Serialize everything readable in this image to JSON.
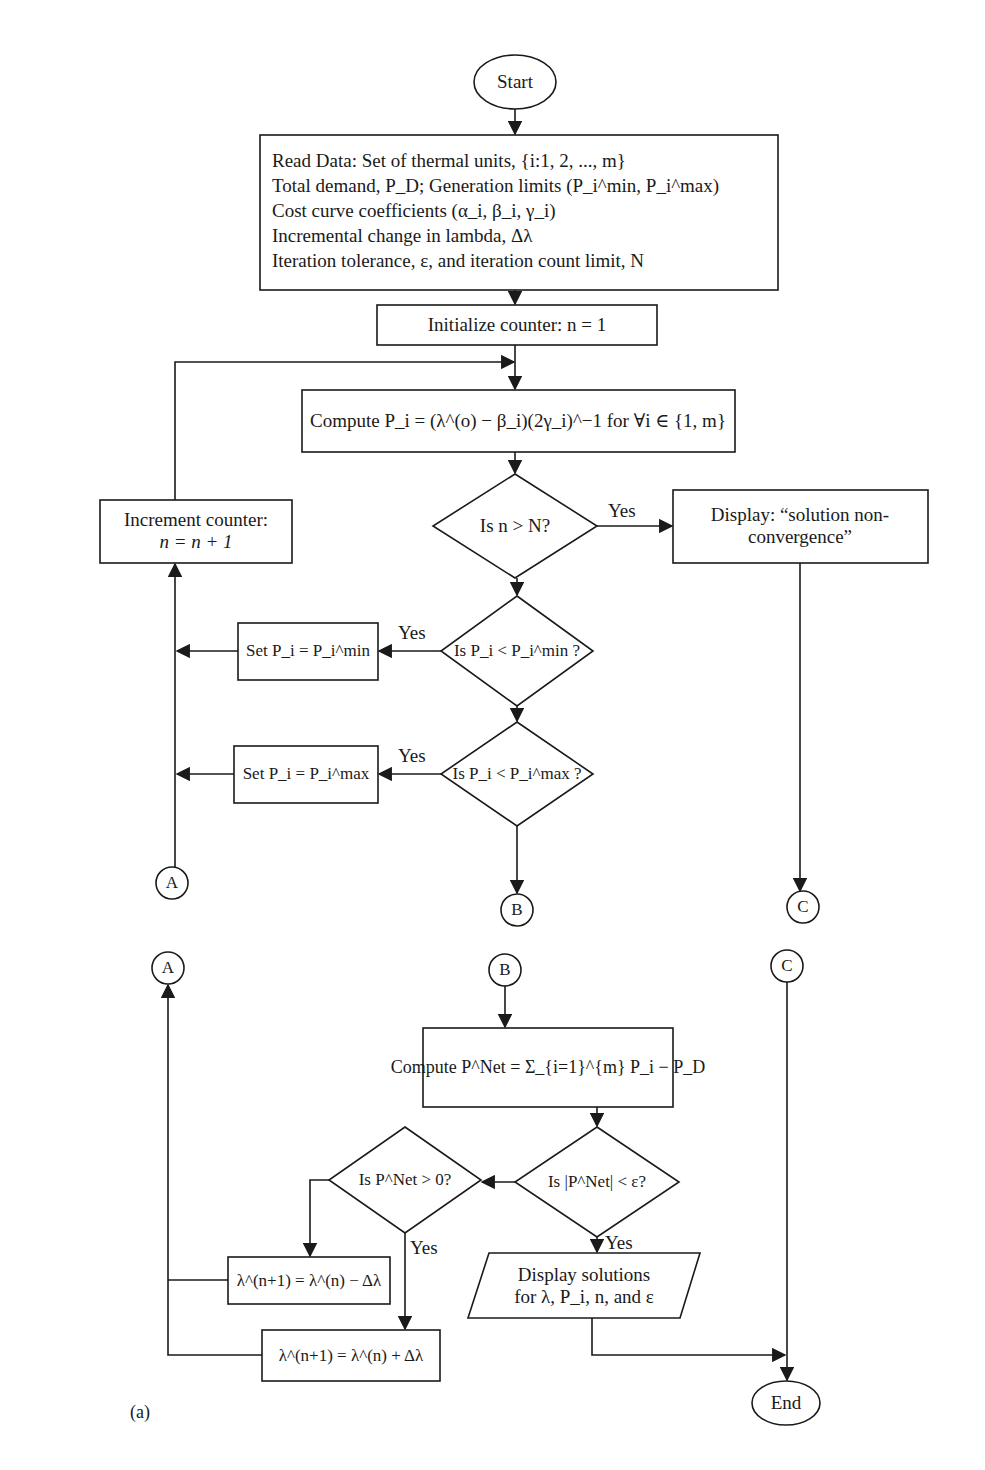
{
  "figure": {
    "caption_label": "(a)",
    "terminals": {
      "start": "Start",
      "end": "End"
    },
    "read_data": {
      "lines": [
        "Read Data: Set of thermal units, {i:1, 2, ..., m}",
        "Total demand, P_D; Generation limits (P_i^min, P_i^max)",
        "Cost curve coefficients (α_i, β_i, γ_i)",
        "Incremental change in lambda, Δλ",
        "Iteration tolerance, ε, and iteration count limit, N"
      ]
    },
    "initialize": "Initialize counter: n = 1",
    "compute_pi": "Compute P_i = (λ^(o) − β_i)(2γ_i)^−1 for ∀i ∈ {1, m}",
    "decision_iter": "Is n > N?",
    "non_convergence": {
      "line1": "Display: “solution non-",
      "line2": "convergence”"
    },
    "increment": {
      "line1": "Increment counter:",
      "line2": "n = n + 1"
    },
    "decision_min": "Is P_i < P_i^min ?",
    "set_min": "Set P_i = P_i^min",
    "decision_max": "Is P_i < P_i^max ?",
    "set_max": "Set P_i = P_i^max",
    "compute_pnet": "Compute P^Net = Σ_{i=1}^{m} P_i − P_D",
    "decision_converge": "Is |P^Net| < ε?",
    "decision_positive": "Is P^Net > 0?",
    "lambda_decrease": "λ^(n+1) = λ^(n) − Δλ",
    "lambda_increase": "λ^(n+1) = λ^(n) + Δλ",
    "display_solutions": {
      "line1": "Display solutions",
      "line2": "for λ, P_i, n, and ε"
    },
    "edge_labels": {
      "yes": "Yes"
    },
    "connectors": [
      "A",
      "B",
      "C"
    ],
    "colors": {
      "stroke": "#1a1a1a",
      "background": "#ffffff"
    }
  }
}
